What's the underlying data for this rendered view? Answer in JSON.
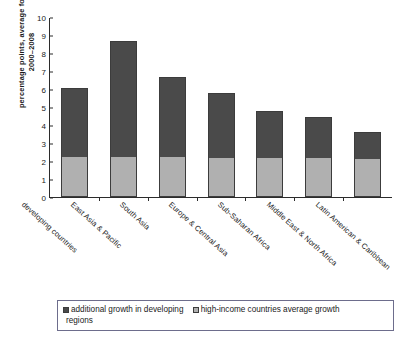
{
  "chart_data": {
    "type": "bar",
    "stacked": true,
    "title": "",
    "xlabel": "",
    "ylabel": "percentage points, average for\n2000–2008",
    "ylim": [
      0,
      10
    ],
    "yticks": [
      10,
      9,
      8,
      7,
      6,
      5,
      4,
      3,
      2,
      1,
      0
    ],
    "grid": false,
    "legend_position": "bottom",
    "categories": [
      "developing countries",
      "East Asia & Pacific",
      "South Asia",
      "Europe & Central Asia",
      "Sub-Saharan Africa",
      "Middle East & North Africa",
      "Latin American & Caribbean"
    ],
    "series": [
      {
        "name": "high-income countries average growth",
        "color": "#b0b0b0",
        "values": [
          2.25,
          2.2,
          2.25,
          2.15,
          2.15,
          2.15,
          2.1
        ]
      },
      {
        "name": "additional growth in developing regions",
        "color": "#4a4a4a",
        "values": [
          3.8,
          6.45,
          4.4,
          3.65,
          2.65,
          2.3,
          1.5
        ]
      }
    ],
    "totals": [
      6.05,
      8.65,
      6.65,
      5.8,
      4.8,
      4.45,
      3.6
    ]
  },
  "legend": {
    "entries": [
      {
        "label": "additional growth in developing",
        "label_wrap": "regions",
        "swatch": "#4a4a4a"
      },
      {
        "label": "high-income countries average growth",
        "label_wrap": "",
        "swatch": "#b0b0b0"
      }
    ]
  }
}
